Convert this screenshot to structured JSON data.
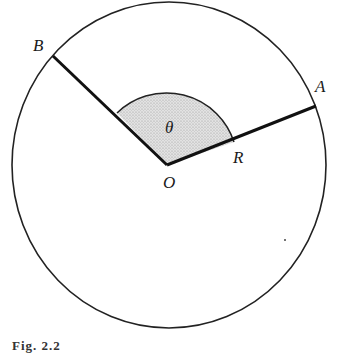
{
  "diagram": {
    "type": "circle-sector",
    "labels": {
      "center": "O",
      "point_a": "A",
      "point_b": "B",
      "radius": "R",
      "angle": "θ"
    },
    "colors": {
      "stroke": "#222222",
      "sector_fill": "#d4d4d4",
      "background": "#ffffff"
    }
  },
  "caption": "Fig. 2.2"
}
